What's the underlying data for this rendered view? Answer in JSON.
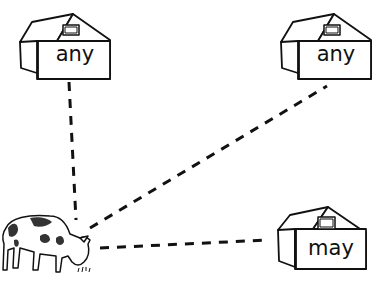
{
  "worksheet": {
    "barns": [
      {
        "id": "top-left",
        "word": "any"
      },
      {
        "id": "top-right",
        "word": "any"
      },
      {
        "id": "bottom-right",
        "word": "may"
      }
    ],
    "cow": {
      "icon": "cow-icon"
    },
    "connectors": [
      {
        "from": "cow",
        "to": "top-left",
        "style": "dashed"
      },
      {
        "from": "cow",
        "to": "top-right",
        "style": "dashed"
      },
      {
        "from": "cow",
        "to": "bottom-right",
        "style": "dashed"
      }
    ],
    "colors": {
      "ink": "#111111",
      "paper": "#ffffff"
    }
  }
}
